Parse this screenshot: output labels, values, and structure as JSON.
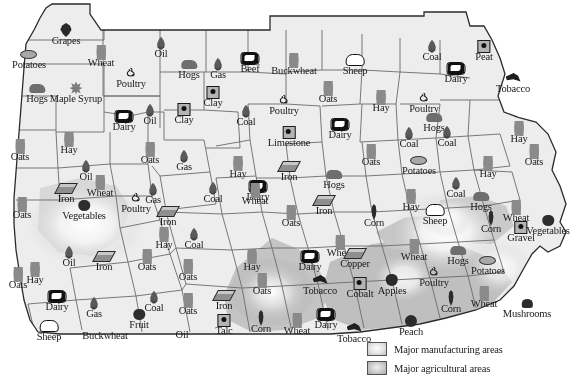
{
  "map": {
    "title": "Pennsylvania natural resources and products map",
    "colors": {
      "land_fill": "#ededed",
      "border_stroke": "#4a4a4a",
      "outline_stroke": "#2b2b2b",
      "manufacturing_glow": "#ffffff",
      "agricultural_shade": "#b9b9b9",
      "label_color": "#1a1a1a",
      "background": "#ffffff"
    }
  },
  "legend": {
    "items": [
      {
        "swatch": "manufacturing-swatch",
        "label": "Major manufacturing areas"
      },
      {
        "swatch": "agricultural-swatch",
        "label": "Major agricultural areas"
      }
    ]
  },
  "markers": [
    {
      "label": "Grapes",
      "icon": "grapes-icon",
      "x": 66,
      "y": 22
    },
    {
      "label": "Potatoes",
      "icon": "potato-icon",
      "x": 29,
      "y": 46
    },
    {
      "label": "Wheat",
      "icon": "wheat-icon",
      "x": 101,
      "y": 44
    },
    {
      "label": "Oil",
      "icon": "flame-icon",
      "x": 161,
      "y": 35
    },
    {
      "label": "Poultry",
      "icon": "chicken-icon",
      "x": 131,
      "y": 65
    },
    {
      "label": "Hogs",
      "icon": "hog-icon",
      "x": 189,
      "y": 56
    },
    {
      "label": "Gas",
      "icon": "flame-icon",
      "x": 218,
      "y": 56
    },
    {
      "label": "Beef",
      "icon": "cow-icon",
      "x": 250,
      "y": 50
    },
    {
      "label": "Buckwheat",
      "icon": "wheat-icon",
      "x": 294,
      "y": 52
    },
    {
      "label": "Sheep",
      "icon": "sheep-icon",
      "x": 355,
      "y": 52
    },
    {
      "label": "Coal",
      "icon": "flame-icon",
      "x": 432,
      "y": 38
    },
    {
      "label": "Peat",
      "icon": "box-icon",
      "x": 484,
      "y": 38
    },
    {
      "label": "Hogs",
      "icon": "hog-icon",
      "x": 37,
      "y": 80
    },
    {
      "label": "Maple Syrup",
      "icon": "maple-icon",
      "x": 76,
      "y": 80
    },
    {
      "label": "Clay",
      "icon": "box-icon",
      "x": 213,
      "y": 84
    },
    {
      "label": "Oats",
      "icon": "wheat-icon",
      "x": 328,
      "y": 80
    },
    {
      "label": "Dairy",
      "icon": "cow-icon",
      "x": 456,
      "y": 60
    },
    {
      "label": "Tobacco",
      "icon": "tobacco-icon",
      "x": 513,
      "y": 70
    },
    {
      "label": "Dairy",
      "icon": "cow-icon",
      "x": 124,
      "y": 108
    },
    {
      "label": "Oil",
      "icon": "flame-icon",
      "x": 150,
      "y": 102
    },
    {
      "label": "Clay",
      "icon": "box-icon",
      "x": 184,
      "y": 101
    },
    {
      "label": "Coal",
      "icon": "flame-icon",
      "x": 246,
      "y": 103
    },
    {
      "label": "Poultry",
      "icon": "chicken-icon",
      "x": 284,
      "y": 92
    },
    {
      "label": "Hay",
      "icon": "wheat-icon",
      "x": 381,
      "y": 89
    },
    {
      "label": "Poultry",
      "icon": "chicken-icon",
      "x": 424,
      "y": 90
    },
    {
      "label": "Limestone",
      "icon": "box-icon",
      "x": 289,
      "y": 124
    },
    {
      "label": "Dairy",
      "icon": "cow-icon",
      "x": 340,
      "y": 116
    },
    {
      "label": "Hogs",
      "icon": "hog-icon",
      "x": 434,
      "y": 109
    },
    {
      "label": "Coal",
      "icon": "flame-icon",
      "x": 409,
      "y": 125
    },
    {
      "label": "Coal",
      "icon": "flame-icon",
      "x": 447,
      "y": 124
    },
    {
      "label": "Hay",
      "icon": "wheat-icon",
      "x": 519,
      "y": 120
    },
    {
      "label": "Oats",
      "icon": "wheat-icon",
      "x": 20,
      "y": 138
    },
    {
      "label": "Hay",
      "icon": "wheat-icon",
      "x": 69,
      "y": 131
    },
    {
      "label": "Oats",
      "icon": "wheat-icon",
      "x": 150,
      "y": 141
    },
    {
      "label": "Gas",
      "icon": "flame-icon",
      "x": 184,
      "y": 148
    },
    {
      "label": "Hay",
      "icon": "wheat-icon",
      "x": 238,
      "y": 155
    },
    {
      "label": "Iron",
      "icon": "ingot-icon",
      "x": 289,
      "y": 158
    },
    {
      "label": "Hogs",
      "icon": "hog-icon",
      "x": 334,
      "y": 166
    },
    {
      "label": "Oats",
      "icon": "wheat-icon",
      "x": 371,
      "y": 143
    },
    {
      "label": "Potatoes",
      "icon": "potato-icon",
      "x": 419,
      "y": 152
    },
    {
      "label": "Hay",
      "icon": "wheat-icon",
      "x": 488,
      "y": 155
    },
    {
      "label": "Oil",
      "icon": "flame-icon",
      "x": 86,
      "y": 158
    },
    {
      "label": "Wheat",
      "icon": "wheat-icon",
      "x": 100,
      "y": 174
    },
    {
      "label": "Iron",
      "icon": "ingot-icon",
      "x": 66,
      "y": 180
    },
    {
      "label": "Gas",
      "icon": "flame-icon",
      "x": 153,
      "y": 181
    },
    {
      "label": "Coal",
      "icon": "flame-icon",
      "x": 213,
      "y": 180
    },
    {
      "label": "Dairy",
      "icon": "cow-icon",
      "x": 258,
      "y": 178
    },
    {
      "label": "Wheat",
      "icon": "wheat-icon",
      "x": 255,
      "y": 182
    },
    {
      "label": "Iron",
      "icon": "ingot-icon",
      "x": 324,
      "y": 192
    },
    {
      "label": "Hay",
      "icon": "wheat-icon",
      "x": 411,
      "y": 188
    },
    {
      "label": "Hogs",
      "icon": "hog-icon",
      "x": 481,
      "y": 188
    },
    {
      "label": "Coal",
      "icon": "flame-icon",
      "x": 456,
      "y": 175
    },
    {
      "label": "Wheat",
      "icon": "wheat-icon",
      "x": 516,
      "y": 199
    },
    {
      "label": "Oats",
      "icon": "wheat-icon",
      "x": 22,
      "y": 196
    },
    {
      "label": "Poultry",
      "icon": "chicken-icon",
      "x": 136,
      "y": 190
    },
    {
      "label": "Vegetables",
      "icon": "berry-icon",
      "x": 84,
      "y": 197
    },
    {
      "label": "Iron",
      "icon": "ingot-icon",
      "x": 168,
      "y": 203
    },
    {
      "label": "Oats",
      "icon": "wheat-icon",
      "x": 291,
      "y": 204
    },
    {
      "label": "Corn",
      "icon": "corn-icon",
      "x": 374,
      "y": 204
    },
    {
      "label": "Sheep",
      "icon": "sheep-icon",
      "x": 435,
      "y": 202
    },
    {
      "label": "Corn",
      "icon": "corn-icon",
      "x": 491,
      "y": 210
    },
    {
      "label": "Gravel",
      "icon": "box-icon",
      "x": 521,
      "y": 219
    },
    {
      "label": "Vegetables",
      "icon": "berry-icon",
      "x": 548,
      "y": 212
    },
    {
      "label": "Hay",
      "icon": "wheat-icon",
      "x": 164,
      "y": 226
    },
    {
      "label": "Coal",
      "icon": "flame-icon",
      "x": 194,
      "y": 226
    },
    {
      "label": "Iron",
      "icon": "ingot-icon",
      "x": 104,
      "y": 248
    },
    {
      "label": "Oats",
      "icon": "wheat-icon",
      "x": 147,
      "y": 248
    },
    {
      "label": "Oil",
      "icon": "flame-icon",
      "x": 69,
      "y": 244
    },
    {
      "label": "Hay",
      "icon": "wheat-icon",
      "x": 35,
      "y": 261
    },
    {
      "label": "Wheat",
      "icon": "wheat-icon",
      "x": 340,
      "y": 234
    },
    {
      "label": "Dairy",
      "icon": "cow-icon",
      "x": 310,
      "y": 248
    },
    {
      "label": "Copper",
      "icon": "ingot-icon",
      "x": 355,
      "y": 245
    },
    {
      "label": "Wheat",
      "icon": "wheat-icon",
      "x": 414,
      "y": 238
    },
    {
      "label": "Hogs",
      "icon": "hog-icon",
      "x": 458,
      "y": 242
    },
    {
      "label": "Poultry",
      "icon": "chicken-icon",
      "x": 434,
      "y": 264
    },
    {
      "label": "Potatoes",
      "icon": "potato-icon",
      "x": 488,
      "y": 252
    },
    {
      "label": "Tobacco",
      "icon": "tobacco-icon",
      "x": 320,
      "y": 272
    },
    {
      "label": "Apples",
      "icon": "apple-icon",
      "x": 392,
      "y": 272
    },
    {
      "label": "Cobalt",
      "icon": "box-icon",
      "x": 360,
      "y": 275
    },
    {
      "label": "Oats",
      "icon": "wheat-icon",
      "x": 262,
      "y": 272
    },
    {
      "label": "Hay",
      "icon": "wheat-icon",
      "x": 252,
      "y": 248
    },
    {
      "label": "Oats",
      "icon": "wheat-icon",
      "x": 18,
      "y": 266
    },
    {
      "label": "Dairy",
      "icon": "cow-icon",
      "x": 57,
      "y": 288
    },
    {
      "label": "Gas",
      "icon": "flame-icon",
      "x": 94,
      "y": 295
    },
    {
      "label": "Coal",
      "icon": "flame-icon",
      "x": 154,
      "y": 289
    },
    {
      "label": "Oats",
      "icon": "wheat-icon",
      "x": 188,
      "y": 292
    },
    {
      "label": "Iron",
      "icon": "ingot-icon",
      "x": 224,
      "y": 287
    },
    {
      "label": "Fruit",
      "icon": "berry-icon",
      "x": 139,
      "y": 306
    },
    {
      "label": "Talc",
      "icon": "box-icon",
      "x": 224,
      "y": 312
    },
    {
      "label": "Corn",
      "icon": "corn-icon",
      "x": 261,
      "y": 310
    },
    {
      "label": "Wheat",
      "icon": "wheat-icon",
      "x": 297,
      "y": 312
    },
    {
      "label": "Dairy",
      "icon": "cow-icon",
      "x": 326,
      "y": 306
    },
    {
      "label": "Tobacco",
      "icon": "tobacco-icon",
      "x": 354,
      "y": 320
    },
    {
      "label": "Peach",
      "icon": "peach-icon",
      "x": 411,
      "y": 313
    },
    {
      "label": "Corn",
      "icon": "corn-icon",
      "x": 451,
      "y": 290
    },
    {
      "label": "Wheat",
      "icon": "wheat-icon",
      "x": 484,
      "y": 285
    },
    {
      "label": "Mushrooms",
      "icon": "mushroom-icon",
      "x": 527,
      "y": 295
    },
    {
      "label": "Sheep",
      "icon": "sheep-icon",
      "x": 49,
      "y": 318
    },
    {
      "label": "Buckwheat",
      "icon": "none",
      "x": 105,
      "y": 330
    },
    {
      "label": "Oil",
      "icon": "none",
      "x": 182,
      "y": 329
    },
    {
      "label": "Oats",
      "icon": "wheat-icon",
      "x": 188,
      "y": 258
    },
    {
      "label": "Oats",
      "icon": "wheat-icon",
      "x": 534,
      "y": 143
    }
  ]
}
